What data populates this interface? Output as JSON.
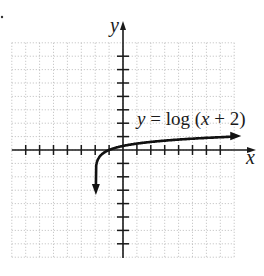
{
  "chart_data": {
    "type": "line",
    "title": "",
    "function": "y = log (x + 2)",
    "xlabel": "x",
    "ylabel": "y",
    "xlim": [
      -8,
      8
    ],
    "ylim": [
      -8,
      8
    ],
    "grid": true,
    "grid_style": "dotted",
    "x_ticks": [
      -7,
      -6,
      -5,
      -4,
      -3,
      -2,
      -1,
      1,
      2,
      3,
      4,
      5,
      6,
      7
    ],
    "y_ticks": [
      -7,
      -6,
      -5,
      -4,
      -3,
      -2,
      -1,
      1,
      2,
      3,
      4,
      5,
      6,
      7
    ],
    "tick_labels_shown": false,
    "series": [
      {
        "name": "y = log (x + 2)",
        "x": [
          -1.95,
          -1.9,
          -1.8,
          -1.5,
          -1,
          0,
          1,
          2,
          3,
          4,
          5,
          6,
          7,
          8
        ],
        "y": [
          -1.3,
          -1.0,
          -0.7,
          -0.3,
          0,
          0.301,
          0.477,
          0.602,
          0.699,
          0.778,
          0.845,
          0.903,
          0.954,
          1.0
        ],
        "arrows": [
          "start",
          "end"
        ],
        "vertical_asymptote": -2
      }
    ],
    "annotations": [
      {
        "text": "y = log (x + 2)",
        "x": 1,
        "y": 2
      }
    ]
  },
  "labels": {
    "x_axis": "x",
    "y_axis": "y",
    "equation_y": "y",
    "equation_rest": " = log (",
    "equation_x": "x",
    "equation_tail": " + 2)"
  },
  "colors": {
    "axis": "#1a1a1a",
    "curve": "#111111",
    "grid": "#b5b5b5",
    "background": "#ffffff"
  }
}
